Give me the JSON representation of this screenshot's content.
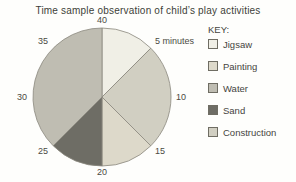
{
  "title": "Time sample observation of child’s play activities",
  "key": {
    "heading": "KEY:",
    "items": [
      {
        "label": "Jigsaw",
        "color": "#f0efe6"
      },
      {
        "label": "Painting",
        "color": "#ddd9ca"
      },
      {
        "label": "Water",
        "color": "#bfbdb2"
      },
      {
        "label": "Sand",
        "color": "#6e6d65"
      },
      {
        "label": "Construction",
        "color": "#d1cfc2"
      }
    ]
  },
  "chart_data": {
    "type": "pie",
    "title": "Time sample observation of child’s play activities",
    "units": "minutes",
    "total_minutes": 40,
    "minutes_per_degree": 0.1111,
    "legend_position": "right",
    "slices": [
      {
        "activity": "Jigsaw",
        "start_minute": 0,
        "end_minute": 5,
        "minutes": 5,
        "color": "#f0efe6"
      },
      {
        "activity": "Construction",
        "start_minute": 5,
        "end_minute": 15,
        "minutes": 10,
        "color": "#d1cfc2"
      },
      {
        "activity": "Painting",
        "start_minute": 15,
        "end_minute": 20,
        "minutes": 5,
        "color": "#ddd9ca"
      },
      {
        "activity": "Sand",
        "start_minute": 20,
        "end_minute": 25,
        "minutes": 5,
        "color": "#6e6d65"
      },
      {
        "activity": "Water",
        "start_minute": 25,
        "end_minute": 40,
        "minutes": 15,
        "color": "#bfbdb2"
      }
    ],
    "ticks": [
      {
        "minute": 5,
        "label": "5 minutes"
      },
      {
        "minute": 10,
        "label": "10"
      },
      {
        "minute": 15,
        "label": "15"
      },
      {
        "minute": 20,
        "label": "20"
      },
      {
        "minute": 25,
        "label": "25"
      },
      {
        "minute": 30,
        "label": "30"
      },
      {
        "minute": 35,
        "label": "35"
      },
      {
        "minute": 40,
        "label": "40"
      }
    ]
  }
}
